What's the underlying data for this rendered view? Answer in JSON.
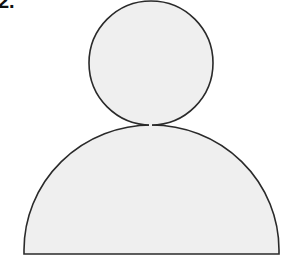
{
  "label": {
    "text": "2."
  },
  "figure": {
    "fill_color": "#efefef",
    "stroke_color": "#2a2a2a",
    "head": {
      "cx": 151,
      "cy": 63,
      "r": 62
    },
    "body": {
      "left": 24,
      "right": 279,
      "top": 125,
      "bottom": 254
    }
  }
}
